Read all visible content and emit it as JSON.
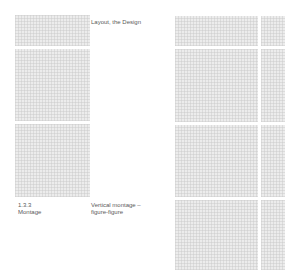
{
  "page": {
    "title": "Layout, the Design",
    "section_number": "1.3.3",
    "section_name": "Montage",
    "caption_line1": "Vertical montage –",
    "caption_line2": "figure-figure"
  },
  "left_column": {
    "panels": [
      {
        "name": "left-panel-1",
        "x": 15,
        "y": 15,
        "w": 75,
        "h": 31
      },
      {
        "name": "left-panel-2",
        "x": 15,
        "y": 49,
        "w": 75,
        "h": 72
      },
      {
        "name": "left-panel-3",
        "x": 15,
        "y": 124,
        "w": 75,
        "h": 73
      }
    ]
  },
  "right_column": {
    "panels": [
      {
        "name": "right-panel-r1-main",
        "x": 175,
        "y": 16,
        "w": 83,
        "h": 30
      },
      {
        "name": "right-panel-r1-strip",
        "x": 261,
        "y": 16,
        "w": 24,
        "h": 30
      },
      {
        "name": "right-panel-r2-main",
        "x": 175,
        "y": 49,
        "w": 83,
        "h": 73
      },
      {
        "name": "right-panel-r2-strip",
        "x": 261,
        "y": 49,
        "w": 24,
        "h": 73
      },
      {
        "name": "right-panel-r3-main",
        "x": 175,
        "y": 125,
        "w": 83,
        "h": 72
      },
      {
        "name": "right-panel-r3-strip",
        "x": 261,
        "y": 125,
        "w": 24,
        "h": 72
      },
      {
        "name": "right-panel-r4-main",
        "x": 175,
        "y": 200,
        "w": 83,
        "h": 70
      },
      {
        "name": "right-panel-r4-strip",
        "x": 261,
        "y": 200,
        "w": 24,
        "h": 70
      }
    ]
  },
  "colors": {
    "panel_fill": "#ececec",
    "grid_line": "#c8c8c8",
    "text": "#5a5a5a",
    "background": "#ffffff"
  }
}
